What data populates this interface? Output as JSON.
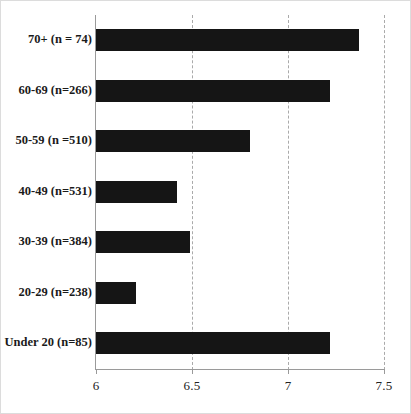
{
  "chart_data": {
    "type": "bar",
    "orientation": "horizontal",
    "title": "",
    "xlabel": "",
    "ylabel": "",
    "categories": [
      "70+ (n = 74)",
      "60-69 (n=266)",
      "50-59 (n =510)",
      "40-49 (n=531)",
      "30-39 (n=384)",
      "20-29 (n=238)",
      "Under 20 (n=85)"
    ],
    "values": [
      7.37,
      7.22,
      6.8,
      6.42,
      6.49,
      6.21,
      7.22
    ],
    "xlim": [
      6,
      7.5
    ],
    "xticks": [
      6,
      6.5,
      7,
      7.5
    ],
    "xticklabels": [
      "6",
      "6.5",
      "7",
      "7.5"
    ],
    "grid": "vertical-dashed",
    "legend": "none",
    "bar_color": "#151515"
  }
}
